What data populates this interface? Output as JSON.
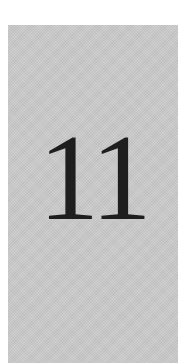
{
  "page": {
    "background_color": "#ffffff",
    "panel_color": "#c9c9c9",
    "chapter_number": "11",
    "text_color": "#1e1e1e"
  }
}
